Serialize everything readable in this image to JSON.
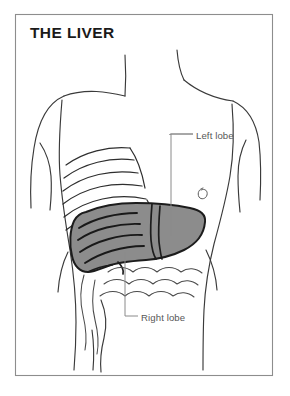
{
  "figure": {
    "title": "THE LIVER",
    "frame": {
      "border_color": "#8d8d8d",
      "background_color": "#ffffff"
    },
    "colors": {
      "organ_fill": "#8c8c8c",
      "organ_outline": "#1c1c1c",
      "body_outline": "#3a3a3a",
      "label_text": "#575757",
      "leader_line": "#8a8a8a",
      "title_text": "#1a1a1a"
    },
    "labels": [
      {
        "id": "left-lobe",
        "text": "Left lobe",
        "leader": "elbow-line from label down to organ left lobe"
      },
      {
        "id": "right-lobe",
        "text": "Right lobe",
        "leader": "elbow-line from label up to organ right lobe"
      }
    ],
    "anatomy_parts": [
      "torso-outline",
      "neck",
      "shoulders",
      "left-arm",
      "right-arm",
      "ribcage",
      "liver",
      "intestines",
      "navel"
    ]
  }
}
